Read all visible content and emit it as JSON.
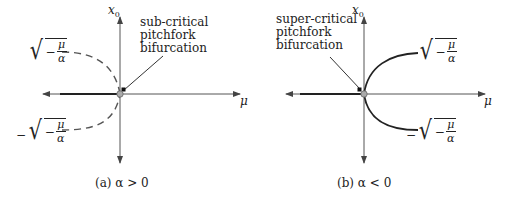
{
  "panels": [
    {
      "id": "a",
      "caption": "(a) α > 0",
      "annotation": [
        "sub-critical",
        "pitchfork",
        "bifurcation"
      ],
      "axis_x_label": "μ",
      "axis_y_label": "x0",
      "upper_branch_label": {
        "sign": "",
        "num": "μ",
        "den": "α",
        "inner_sign": "−"
      },
      "lower_branch_label": {
        "sign": "−",
        "num": "μ",
        "den": "α",
        "inner_sign": "−"
      },
      "branch_style": "dashed",
      "branch_side": "left"
    },
    {
      "id": "b",
      "caption": "(b) α < 0",
      "annotation": [
        "super-critical",
        "pitchfork",
        "bifurcation"
      ],
      "axis_x_label": "μ",
      "axis_y_label": "x0",
      "upper_branch_label": {
        "sign": "",
        "num": "μ",
        "den": "α",
        "inner_sign": "−"
      },
      "lower_branch_label": {
        "sign": "−",
        "num": "μ",
        "den": "α",
        "inner_sign": "−"
      },
      "branch_style": "solid",
      "branch_side": "right"
    }
  ],
  "colors": {
    "ink": "#222222",
    "axis": "#555555",
    "origin_fill": "#aaaaaa"
  }
}
